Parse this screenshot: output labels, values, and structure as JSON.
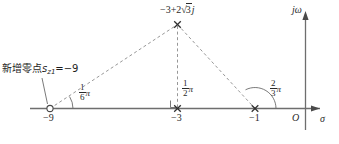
{
  "figure": {
    "type": "pole-zero-root-locus-plot",
    "plane": "s-plane",
    "background_color": "#ffffff",
    "axis_color": "#6e6e6e",
    "dash_color": "#8c8c8c",
    "text_color": "#1d1d1d"
  },
  "axes": {
    "real": {
      "name": "sigma",
      "label": "σ",
      "arrow": "right"
    },
    "imag": {
      "name": "j-omega",
      "label": "jω",
      "arrow": "up"
    },
    "origin_label": "O"
  },
  "tick_labels": [
    {
      "name": "tick-minus-9",
      "text": "−9",
      "value": -9
    },
    {
      "name": "tick-minus-3",
      "text": "−3",
      "value": -3
    },
    {
      "name": "tick-minus-1",
      "text": "−1",
      "value": -1
    }
  ],
  "markers": [
    {
      "name": "zero-at-minus-9",
      "glyph": "open-circle",
      "type": "zero",
      "value": -9
    },
    {
      "name": "pole-at-minus-3",
      "glyph": "cross",
      "type": "pole",
      "value": -3
    },
    {
      "name": "pole-at-minus-1",
      "glyph": "cross",
      "type": "pole",
      "value": -1
    },
    {
      "name": "pole-complex-upper",
      "glyph": "cross",
      "type": "pole",
      "value": "-3+2√3j"
    }
  ],
  "annotations": {
    "added_zero": {
      "text_prefix": "新增零点",
      "symbol": "s",
      "symbol_sub": "z1",
      "equals": "=−9",
      "full_text": "新增零点s₂₁=−9"
    },
    "complex_pole_label": {
      "prefix": "−3+2",
      "radical": "√",
      "radicand": "3",
      "suffix": "j",
      "full_text": "−3+2√3j"
    }
  },
  "angles": [
    {
      "name": "angle-one-sixth-pi",
      "numerator": "1",
      "denominator": "6",
      "symbol": "π",
      "full_text": "1/6 π",
      "vertex_value": -9
    },
    {
      "name": "angle-one-half-pi",
      "numerator": "1",
      "denominator": "2",
      "symbol": "π",
      "full_text": "1/2 π",
      "vertex_value": -3
    },
    {
      "name": "angle-two-thirds-pi",
      "numerator": "2",
      "denominator": "3",
      "symbol": "π",
      "full_text": "2/3 π",
      "vertex_value": -1
    }
  ]
}
